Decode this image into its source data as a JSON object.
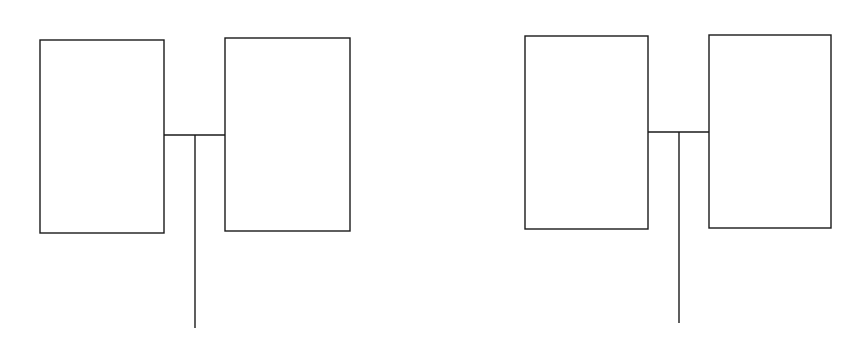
{
  "diagram": {
    "background": "#ffffff",
    "stroke": "#1a1a1a",
    "stroke_width": 1.4,
    "groups": [
      {
        "name": "left-pair",
        "boxes": [
          {
            "x": 40,
            "y": 40,
            "w": 124,
            "h": 193
          },
          {
            "x": 225,
            "y": 38,
            "w": 125,
            "h": 193
          }
        ],
        "connector": {
          "x1": 164,
          "x2": 225,
          "y": 135
        },
        "stem": {
          "x": 195,
          "y1": 135,
          "y2": 328
        }
      },
      {
        "name": "right-pair",
        "boxes": [
          {
            "x": 525,
            "y": 36,
            "w": 123,
            "h": 193
          },
          {
            "x": 709,
            "y": 35,
            "w": 122,
            "h": 193
          }
        ],
        "connector": {
          "x1": 648,
          "x2": 709,
          "y": 132
        },
        "stem": {
          "x": 679,
          "y1": 132,
          "y2": 323
        }
      }
    ]
  }
}
